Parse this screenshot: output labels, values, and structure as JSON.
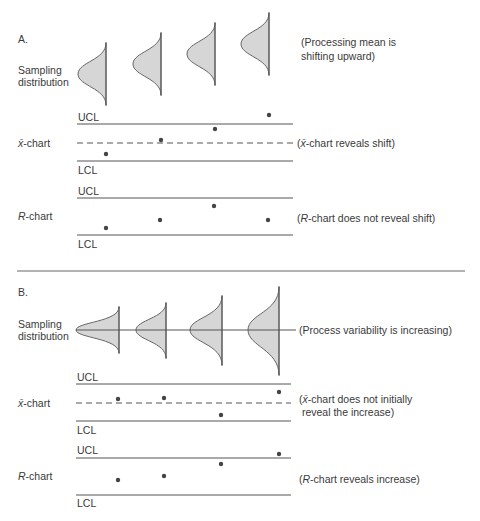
{
  "panelA": {
    "label": "A.",
    "sampling_label_1": "Sampling",
    "sampling_label_2": "distribution",
    "sampling_note_1": "(Processing mean is",
    "sampling_note_2": "shifting upward)",
    "xchart": {
      "label_x": "x̄",
      "label_rest": "-chart",
      "ucl": "UCL",
      "lcl": "LCL",
      "note_open": "(",
      "note_x": "x̄",
      "note_rest": "-chart reveals shift)"
    },
    "rchart": {
      "label_r": "R",
      "label_rest": "-chart",
      "ucl": "UCL",
      "lcl": "LCL",
      "note_open": "(",
      "note_r": "R",
      "note_rest": "-chart does not reveal shift)"
    }
  },
  "panelB": {
    "label": "B.",
    "sampling_label_1": "Sampling",
    "sampling_label_2": "distribution",
    "sampling_note": "(Process variability is increasing)",
    "xchart": {
      "label_x": "x̄",
      "label_rest": "-chart",
      "ucl": "UCL",
      "lcl": "LCL",
      "note_open": "(",
      "note_x": "x̄",
      "note_rest_1": "-chart does not initially",
      "note_rest_2": " reveal the increase)"
    },
    "rchart": {
      "label_r": "R",
      "label_rest": "-chart",
      "ucl": "UCL",
      "lcl": "LCL",
      "note_open": "(",
      "note_r": "R",
      "note_rest": "-chart reveals increase)"
    }
  },
  "colors": {
    "line": "#555555",
    "fill": "#d3d3d3",
    "text": "#3a3a3a"
  }
}
